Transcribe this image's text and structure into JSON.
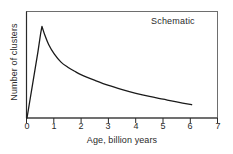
{
  "chart_data": {
    "type": "line",
    "title": "",
    "annotation": "Schematic",
    "xlabel": "Age, billion years",
    "ylabel": "Number of clusters",
    "xlim": [
      0,
      7
    ],
    "ylim": [
      0,
      1
    ],
    "grid": false,
    "legend": null,
    "xticks": [
      0,
      1,
      2,
      3,
      4,
      5,
      6,
      7
    ],
    "xtick_labels": [
      "0",
      "1",
      "2",
      "3",
      "4",
      "5",
      "6",
      "7"
    ],
    "yticks": [],
    "ytick_labels": [],
    "line_color": "#1a1a1a",
    "axis_color": "#4a4a4a",
    "background": "#ffffff",
    "series": [
      {
        "name": "Number of clusters",
        "x": [
          0.0,
          0.1,
          0.2,
          0.3,
          0.4,
          0.5,
          0.55,
          0.65,
          0.8,
          1.0,
          1.25,
          1.5,
          1.75,
          2.0,
          2.5,
          3.0,
          3.5,
          4.0,
          4.5,
          5.0,
          5.5,
          6.05
        ],
        "y": [
          0.0,
          0.18,
          0.36,
          0.54,
          0.72,
          0.92,
          1.0,
          0.91,
          0.8,
          0.7,
          0.61,
          0.555,
          0.51,
          0.47,
          0.41,
          0.355,
          0.31,
          0.27,
          0.235,
          0.205,
          0.175,
          0.145
        ]
      }
    ]
  }
}
